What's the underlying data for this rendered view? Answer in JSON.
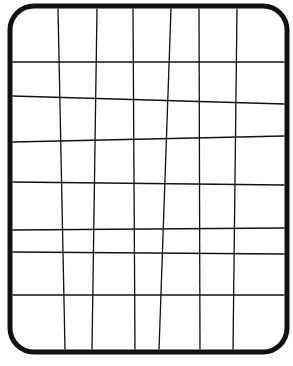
{
  "figure": {
    "colors": {
      "background": "#ffffff",
      "stroke": "#111111"
    },
    "frame": {
      "x": 10,
      "y": 6,
      "width": 277,
      "height": 346,
      "radius": 24,
      "stroke_width": 5
    },
    "vertical_lines": [
      {
        "x_top": 58,
        "x_bottom": 65
      },
      {
        "x_top": 97,
        "x_bottom": 92
      },
      {
        "x_top": 133,
        "x_bottom": 135
      },
      {
        "x_top": 171,
        "x_bottom": 159
      },
      {
        "x_top": 199,
        "x_bottom": 200
      },
      {
        "x_top": 237,
        "x_bottom": 233
      }
    ],
    "horizontal_lines": [
      {
        "y_left": 62,
        "y_right": 62
      },
      {
        "y_left": 96,
        "y_right": 104
      },
      {
        "y_left": 142,
        "y_right": 136
      },
      {
        "y_left": 182,
        "y_right": 185
      },
      {
        "y_left": 230,
        "y_right": 228
      },
      {
        "y_left": 252,
        "y_right": 254
      },
      {
        "y_left": 295,
        "y_right": 295
      }
    ],
    "line_stroke_width": 1.3
  }
}
